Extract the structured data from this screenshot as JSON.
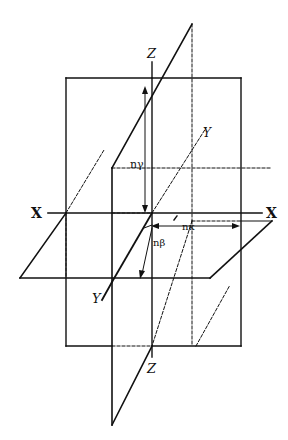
{
  "diagram": {
    "type": "coordinate-planes",
    "colors": {
      "line": "#111111",
      "background": "#ffffff"
    },
    "axes": {
      "x_left": "X",
      "x_right": "X",
      "y_top": "Y",
      "y_bottom": "Y",
      "z_top": "Z",
      "z_bottom": "Z"
    },
    "vectors": {
      "n_gamma": "nγ",
      "n_kappa": "nκ",
      "n_beta": "nβ"
    }
  }
}
